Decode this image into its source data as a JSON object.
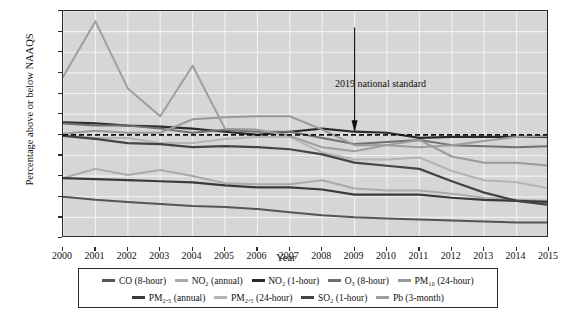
{
  "chart_data": {
    "type": "line",
    "title": "",
    "xlabel": "Year",
    "ylabel": "Percentage above or below NAAQS",
    "x": [
      2000,
      2001,
      2002,
      2003,
      2004,
      2005,
      2006,
      2007,
      2008,
      2009,
      2010,
      2011,
      2012,
      2013,
      2014,
      2015
    ],
    "xlim": [
      2000,
      2015
    ],
    "ylim": [
      -100,
      120
    ],
    "yticks": [
      120,
      100,
      80,
      60,
      40,
      20,
      0,
      -20,
      -40,
      -60,
      -80,
      -100
    ],
    "ytick_labels": [
      "120%",
      "100",
      "80",
      "60",
      "40",
      "20",
      "0",
      "–20",
      "–40",
      "–60",
      "–80",
      "–100"
    ],
    "grid": true,
    "legend_position": "below",
    "zero_reference_line": {
      "value": 0,
      "style": "dashed",
      "color": "#111111"
    },
    "annotations": [
      {
        "text": "2019 national standard",
        "x": 2009,
        "y": 0,
        "arrow": "down"
      }
    ],
    "series": [
      {
        "name": "CO (8-hour)",
        "color": "#555555",
        "width": 2.0,
        "values": [
          -60,
          -63,
          -65,
          -67,
          -69,
          -70,
          -72,
          -75,
          -78,
          -80,
          -81,
          -82,
          -83,
          -84,
          -85,
          -85
        ]
      },
      {
        "name": "NO₂ (annual)",
        "color": "#aaaaaa",
        "width": 2.0,
        "values": [
          -42,
          -33,
          -39,
          -34,
          -40,
          -47,
          -48,
          -48,
          -44,
          -52,
          -54,
          -54,
          -57,
          -61,
          -63,
          -64
        ]
      },
      {
        "name": "NO₂ (1-hour)",
        "color": "#2b2b2b",
        "width": 2.2,
        "values": [
          12,
          11,
          9,
          8,
          6,
          3,
          0,
          3,
          6,
          3,
          2,
          -3,
          -2,
          -2,
          -2,
          -2
        ]
      },
      {
        "name": "O₃ (8-hour)",
        "color": "#707070",
        "width": 2.0,
        "values": [
          11,
          9,
          9,
          6,
          2,
          5,
          3,
          3,
          -3,
          -9,
          -7,
          -5,
          -10,
          -11,
          -12,
          -11
        ]
      },
      {
        "name": "PM₁₀ (24-hour)",
        "color": "#9a9a9a",
        "width": 2.0,
        "values": [
          1,
          4,
          2,
          2,
          15,
          17,
          18,
          18,
          5,
          -10,
          -10,
          -5,
          -21,
          -27,
          -27,
          -30
        ]
      },
      {
        "name": "PM₂.₅ (annual)",
        "color": "#3a3a3a",
        "width": 2.2,
        "values": [
          -42,
          -43,
          -44,
          -45,
          -46,
          -49,
          -51,
          -51,
          -53,
          -58,
          -58,
          -58,
          -61,
          -63,
          -64,
          -65
        ]
      },
      {
        "name": "PM₂.₅ (24-hour)",
        "color": "#b4b4b4",
        "width": 2.0,
        "values": [
          0,
          -3,
          -3,
          -8,
          -8,
          -4,
          -2,
          -2,
          -17,
          -24,
          -24,
          -22,
          -35,
          -44,
          -46,
          -52
        ]
      },
      {
        "name": "SO₂ (1-hour)",
        "color": "#444444",
        "width": 2.2,
        "values": [
          -1,
          -4,
          -8,
          -9,
          -12,
          -11,
          -12,
          -14,
          -19,
          -27,
          -30,
          -33,
          -45,
          -56,
          -64,
          -68
        ]
      },
      {
        "name": "Pb (3-month)",
        "color": "#9e9e9e",
        "width": 2.0,
        "values": [
          56,
          110,
          45,
          18,
          67,
          6,
          5,
          -1,
          -12,
          -16,
          -10,
          -12,
          -10,
          -6,
          -2,
          -1
        ]
      }
    ]
  },
  "axis": {
    "ytitle": "Percentage above or below NAAQS",
    "xtitle": "Year",
    "ytick_labels": [
      "120%",
      "100",
      "80",
      "60",
      "40",
      "20",
      "0",
      "–20",
      "–40",
      "–60",
      "–80",
      "–100"
    ],
    "xtick_labels": [
      "2000",
      "2001",
      "2002",
      "2003",
      "2004",
      "2005",
      "2006",
      "2007",
      "2008",
      "2009",
      "2010",
      "2011",
      "2012",
      "2013",
      "2014",
      "2015"
    ]
  },
  "annotation": {
    "standard_label": "2019 national standard"
  },
  "legend": {
    "row1": [
      {
        "label": "CO (8-hour)",
        "color": "#555555"
      },
      {
        "label": "NO₂ (annual)",
        "color": "#aaaaaa"
      },
      {
        "label": "NO₂ (1-hour)",
        "color": "#2b2b2b"
      },
      {
        "label": "O₃ (8-hour)",
        "color": "#707070"
      },
      {
        "label": "PM₁₀ (24-hour)",
        "color": "#9a9a9a"
      }
    ],
    "row2": [
      {
        "label": "PM₂.₅ (annual)",
        "color": "#3a3a3a"
      },
      {
        "label": "PM₂.₅ (24-hour)",
        "color": "#b4b4b4"
      },
      {
        "label": "SO₂ (1-hour)",
        "color": "#444444"
      },
      {
        "label": "Pb (3-month)",
        "color": "#9e9e9e"
      }
    ]
  },
  "colors": {
    "plot_background": "#d6d6d6",
    "gridline": "#f2f2f2",
    "axis": "#2a2a2a",
    "page_background": "#ffffff"
  }
}
